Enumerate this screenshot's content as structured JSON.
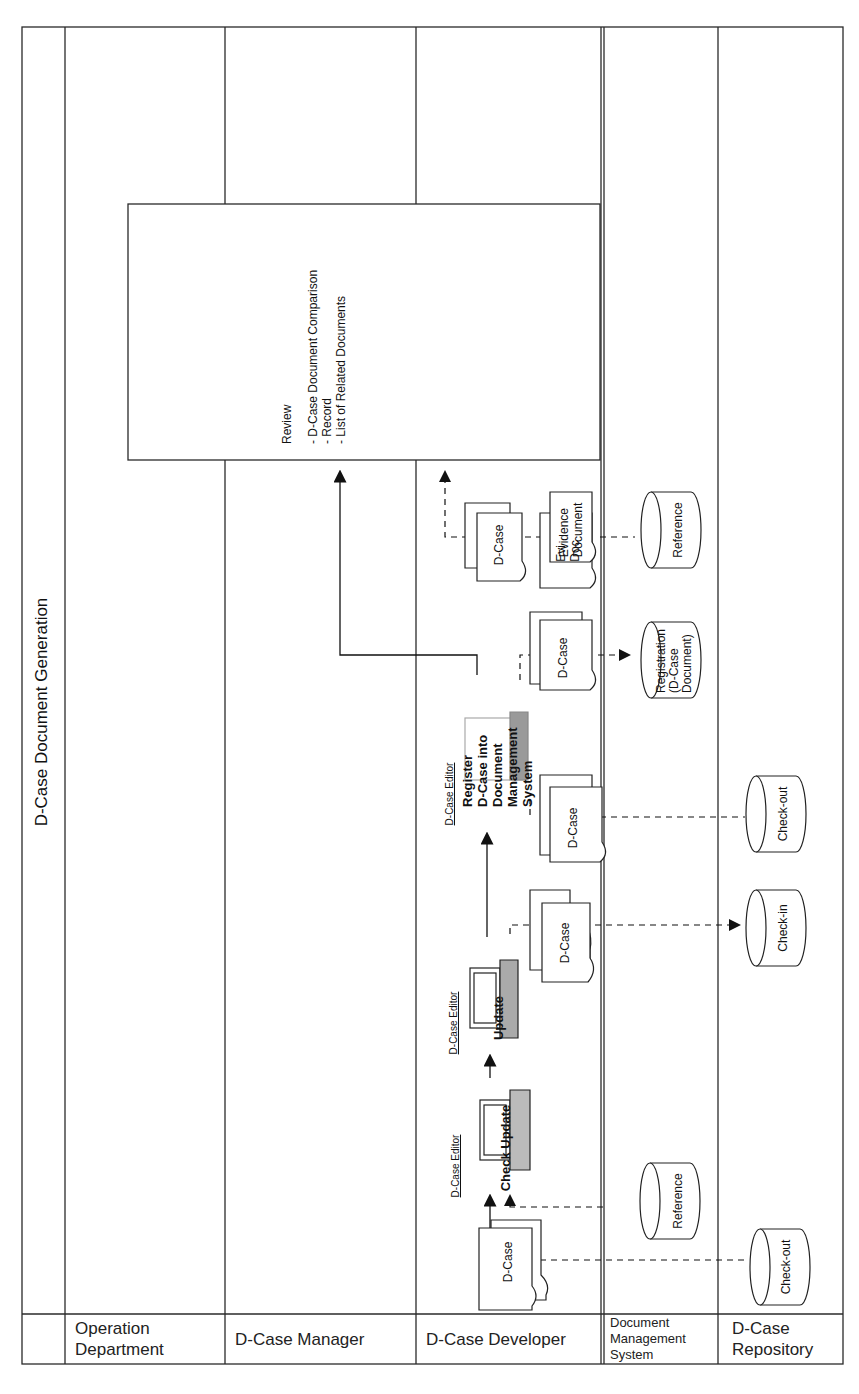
{
  "diagram": {
    "title": "D-Case Document Generation",
    "lanes": [
      {
        "id": "operation",
        "label": "Operation\nDepartment"
      },
      {
        "id": "manager",
        "label": "D-Case Manager"
      },
      {
        "id": "developer",
        "label": "D-Case Developer"
      },
      {
        "id": "dms",
        "label": "Document\nManagement\nSystem"
      },
      {
        "id": "repository",
        "label": "D-Case\nRepository"
      }
    ],
    "review": {
      "title": "Review",
      "items": [
        "- D-Case Document Comparison",
        "- Record",
        "- List of Related Documents"
      ]
    },
    "documents": {
      "dcase_label": "D-Case",
      "evidence_label": "Evidence\nDocument",
      "evidence_back_label": "Evi\nDoc"
    },
    "tools": {
      "editor_label": "D-Case Editor",
      "check_update": "Check Update",
      "update": "Update",
      "register": "Register\nD-Case into\nDocument\nManagement\nSystem"
    },
    "stores": {
      "reference_1": "Reference",
      "reference_2": "Reference",
      "registration": "Registration\n(D-Case\nDocument)",
      "checkout_1": "Check-out",
      "checkin": "Check-in",
      "checkout_2": "Check-out"
    },
    "colors": {
      "line": "#2a2a2a",
      "background": "#ffffff",
      "screen_shadow": "#9a9a9a"
    }
  }
}
